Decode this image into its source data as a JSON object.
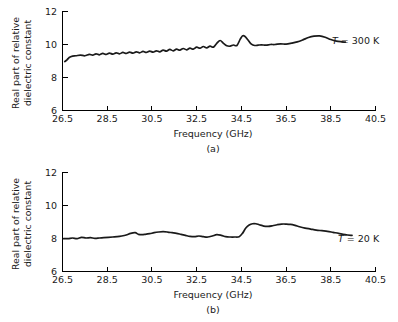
{
  "figure": {
    "panels": [
      {
        "id": "a",
        "caption": "(a)",
        "series_label_var": "T",
        "series_label_value": "= 300 K"
      },
      {
        "id": "b",
        "caption": "(b)",
        "series_label_var": "T",
        "series_label_value": "= 20 K"
      }
    ],
    "axis": {
      "xlabel": "Frequency (GHz)",
      "ylabel_line1": "Real part of relative",
      "ylabel_line2": "dielectric constant",
      "xticks": [
        "26.5",
        "28.5",
        "30.5",
        "32.5",
        "34.5",
        "36.5",
        "38.5",
        "40.5"
      ],
      "yticks": [
        "6",
        "8",
        "10",
        "12"
      ]
    },
    "colors": {
      "curve": "#1a1a1a",
      "axis": "#000000",
      "background": "#ffffff"
    }
  },
  "chart_data": [
    {
      "type": "line",
      "id": "a",
      "title": "",
      "xlabel": "Frequency (GHz)",
      "ylabel": "Real part of relative dielectric constant",
      "xlim": [
        26.5,
        40.5
      ],
      "ylim": [
        6,
        12
      ],
      "xticks": [
        26.5,
        28.5,
        30.5,
        32.5,
        34.5,
        36.5,
        38.5,
        40.5
      ],
      "yticks": [
        6,
        8,
        10,
        12
      ],
      "grid": false,
      "legend": "T = 300 K",
      "legend_position": "right-of-axes",
      "series": [
        {
          "name": "T = 300 K",
          "x": [
            26.6,
            26.7,
            26.8,
            26.95,
            27.1,
            27.3,
            27.5,
            27.7,
            27.85,
            28.0,
            28.15,
            28.3,
            28.45,
            28.6,
            28.75,
            28.9,
            29.05,
            29.2,
            29.35,
            29.5,
            29.65,
            29.8,
            29.95,
            30.1,
            30.25,
            30.4,
            30.55,
            30.7,
            30.85,
            31.0,
            31.15,
            31.3,
            31.45,
            31.6,
            31.75,
            31.9,
            32.05,
            32.2,
            32.35,
            32.5,
            32.65,
            32.8,
            32.95,
            33.1,
            33.25,
            33.4,
            33.55,
            33.7,
            33.85,
            34.0,
            34.15,
            34.3,
            34.45,
            34.55,
            34.65,
            34.8,
            34.95,
            35.1,
            35.25,
            35.4,
            35.6,
            35.8,
            36.0,
            36.25,
            36.5,
            36.75,
            37.0,
            37.25,
            37.5,
            37.75,
            38.0,
            38.25,
            38.5,
            38.75,
            39.0,
            39.15
          ],
          "y": [
            8.95,
            9.05,
            9.2,
            9.28,
            9.3,
            9.34,
            9.3,
            9.38,
            9.34,
            9.42,
            9.36,
            9.44,
            9.38,
            9.46,
            9.4,
            9.48,
            9.42,
            9.5,
            9.44,
            9.52,
            9.46,
            9.54,
            9.48,
            9.56,
            9.5,
            9.58,
            9.52,
            9.6,
            9.54,
            9.64,
            9.58,
            9.68,
            9.6,
            9.7,
            9.64,
            9.74,
            9.66,
            9.76,
            9.7,
            9.82,
            9.76,
            9.86,
            9.78,
            9.88,
            9.82,
            10.05,
            10.22,
            10.05,
            9.9,
            9.88,
            9.95,
            9.92,
            10.3,
            10.5,
            10.48,
            10.25,
            10.0,
            9.92,
            9.94,
            9.96,
            9.94,
            9.98,
            9.98,
            10.02,
            10.0,
            10.06,
            10.14,
            10.26,
            10.4,
            10.48,
            10.5,
            10.42,
            10.28,
            10.18,
            10.14,
            10.12
          ]
        }
      ]
    },
    {
      "type": "line",
      "id": "b",
      "title": "",
      "xlabel": "Frequency (GHz)",
      "ylabel": "Real part of relative dielectric constant",
      "xlim": [
        26.5,
        40.5
      ],
      "ylim": [
        6,
        12
      ],
      "xticks": [
        26.5,
        28.5,
        30.5,
        32.5,
        34.5,
        36.5,
        38.5,
        40.5
      ],
      "yticks": [
        6,
        8,
        10,
        12
      ],
      "grid": false,
      "legend": "T = 20 K",
      "legend_position": "right-of-axes",
      "series": [
        {
          "name": "T = 20 K",
          "x": [
            26.55,
            26.75,
            26.95,
            27.15,
            27.35,
            27.55,
            27.75,
            27.95,
            28.15,
            28.35,
            28.55,
            28.75,
            28.95,
            29.15,
            29.35,
            29.55,
            29.75,
            29.9,
            30.05,
            30.2,
            30.4,
            30.6,
            30.8,
            31.0,
            31.2,
            31.4,
            31.6,
            31.8,
            32.0,
            32.2,
            32.4,
            32.6,
            32.8,
            33.0,
            33.2,
            33.4,
            33.6,
            33.8,
            34.0,
            34.2,
            34.4,
            34.55,
            34.7,
            34.85,
            35.0,
            35.15,
            35.3,
            35.5,
            35.7,
            35.9,
            36.1,
            36.3,
            36.5,
            36.7,
            36.9,
            37.1,
            37.35,
            37.6,
            37.85,
            38.1,
            38.35,
            38.6,
            38.85,
            39.05,
            39.25,
            39.45
          ],
          "y": [
            7.98,
            7.98,
            8.02,
            7.98,
            8.06,
            8.02,
            8.04,
            8.0,
            8.02,
            8.04,
            8.06,
            8.08,
            8.1,
            8.14,
            8.2,
            8.3,
            8.34,
            8.24,
            8.22,
            8.24,
            8.28,
            8.34,
            8.38,
            8.4,
            8.38,
            8.34,
            8.3,
            8.24,
            8.18,
            8.12,
            8.1,
            8.14,
            8.1,
            8.08,
            8.14,
            8.22,
            8.18,
            8.1,
            8.08,
            8.08,
            8.1,
            8.3,
            8.62,
            8.8,
            8.88,
            8.88,
            8.82,
            8.74,
            8.72,
            8.76,
            8.82,
            8.86,
            8.86,
            8.84,
            8.78,
            8.7,
            8.62,
            8.56,
            8.5,
            8.46,
            8.42,
            8.36,
            8.3,
            8.24,
            8.2,
            8.18
          ]
        }
      ]
    }
  ]
}
